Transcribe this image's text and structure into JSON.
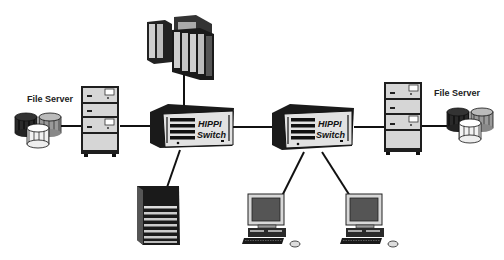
{
  "diagram": {
    "type": "network-topology",
    "nodes": [
      {
        "id": "supercomputer",
        "kind": "mainframe-cluster"
      },
      {
        "id": "switch-left",
        "kind": "switch",
        "label_line1": "HIPPI",
        "label_line2": "Switch"
      },
      {
        "id": "switch-right",
        "kind": "switch",
        "label_line1": "HIPPI",
        "label_line2": "Switch"
      },
      {
        "id": "file-server-left",
        "kind": "file-server",
        "label": "File Server"
      },
      {
        "id": "file-server-right",
        "kind": "file-server",
        "label": "File Server"
      },
      {
        "id": "storage-array",
        "kind": "disk-array"
      },
      {
        "id": "workstation-1",
        "kind": "workstation"
      },
      {
        "id": "workstation-2",
        "kind": "workstation"
      }
    ],
    "edges": [
      [
        "file-server-left",
        "switch-left"
      ],
      [
        "supercomputer",
        "switch-left"
      ],
      [
        "switch-left",
        "switch-right"
      ],
      [
        "switch-left",
        "storage-array"
      ],
      [
        "switch-right",
        "workstation-1"
      ],
      [
        "switch-right",
        "workstation-2"
      ],
      [
        "switch-right",
        "file-server-right"
      ]
    ]
  },
  "labels": {
    "file_server_left": "File Server",
    "file_server_right": "File Server",
    "switch_left_line1": "HIPPI",
    "switch_left_line2": "Switch",
    "switch_right_line1": "HIPPI",
    "switch_right_line2": "Switch"
  }
}
